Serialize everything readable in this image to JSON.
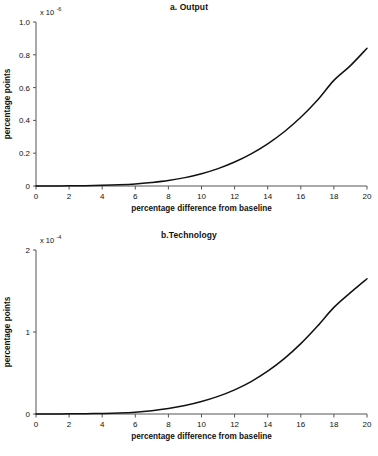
{
  "figure": {
    "background": "#ffffff",
    "curve_color": "#111111",
    "axis_color": "#555555"
  },
  "chart_data": [
    {
      "type": "line",
      "panel_id": "a",
      "title": "a. Output",
      "xlabel": "percentage difference from baseline",
      "ylabel": "percentage points",
      "y_multiplier_prefix": "x 10",
      "y_multiplier_exponent": "-6",
      "xlim": [
        0,
        20
      ],
      "ylim": [
        0,
        1.0
      ],
      "xticks": [
        0,
        2,
        4,
        6,
        8,
        10,
        12,
        14,
        16,
        18,
        20
      ],
      "xtick_labels": [
        "0",
        "2",
        "4",
        "6",
        "8",
        "10",
        "12",
        "14",
        "16",
        "18",
        "20"
      ],
      "yticks": [
        0,
        0.2,
        0.4,
        0.6,
        0.8,
        1.0
      ],
      "ytick_labels": [
        "0",
        "0.2",
        "0.4",
        "0.6",
        "0.8",
        "1.0"
      ],
      "grid": false,
      "legend": false,
      "series": [
        {
          "name": "output",
          "x": [
            0,
            1,
            2,
            3,
            4,
            5,
            6,
            7,
            8,
            9,
            10,
            11,
            12,
            13,
            14,
            15,
            16,
            17,
            18,
            19,
            20
          ],
          "values": [
            0.0,
            0.0005,
            0.001,
            0.002,
            0.004,
            0.007,
            0.012,
            0.021,
            0.033,
            0.051,
            0.075,
            0.106,
            0.146,
            0.196,
            0.257,
            0.331,
            0.419,
            0.523,
            0.644,
            0.734,
            0.84
          ]
        }
      ]
    },
    {
      "type": "line",
      "panel_id": "b",
      "title": "b.Technology",
      "xlabel": "percentage difference from baseline",
      "ylabel": "percentage points",
      "y_multiplier_prefix": "x 10",
      "y_multiplier_exponent": "-4",
      "xlim": [
        0,
        20
      ],
      "ylim": [
        0,
        2
      ],
      "xticks": [
        0,
        2,
        4,
        6,
        8,
        10,
        12,
        14,
        16,
        18,
        20
      ],
      "xtick_labels": [
        "0",
        "2",
        "4",
        "6",
        "8",
        "10",
        "12",
        "14",
        "16",
        "18",
        "20"
      ],
      "yticks": [
        0,
        1,
        2
      ],
      "ytick_labels": [
        "0",
        "1",
        "2"
      ],
      "grid": false,
      "legend": false,
      "series": [
        {
          "name": "technology",
          "x": [
            0,
            1,
            2,
            3,
            4,
            5,
            6,
            7,
            8,
            9,
            10,
            11,
            12,
            13,
            14,
            15,
            16,
            17,
            18,
            19,
            20
          ],
          "values": [
            0.0,
            0.001,
            0.002,
            0.004,
            0.007,
            0.012,
            0.022,
            0.04,
            0.066,
            0.103,
            0.152,
            0.215,
            0.295,
            0.396,
            0.522,
            0.675,
            0.858,
            1.07,
            1.3,
            1.48,
            1.65
          ]
        }
      ]
    }
  ]
}
